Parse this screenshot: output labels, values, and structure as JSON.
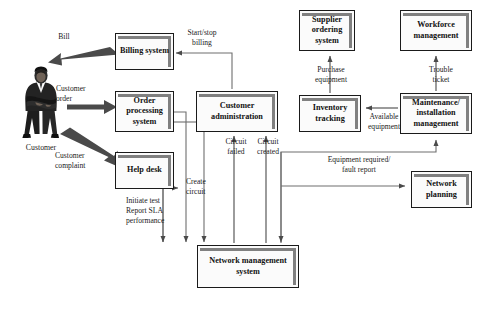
{
  "diagram": {
    "actor": {
      "name": "Customer",
      "icon": "person-businessman-icon"
    },
    "boxes": [
      {
        "id": "billing-system",
        "label": "Billing\nsystem",
        "x": 115,
        "y": 33,
        "w": 59,
        "h": 37
      },
      {
        "id": "order-processing",
        "label": "Order\nprocessing\nsystem",
        "x": 115,
        "y": 91,
        "w": 59,
        "h": 41
      },
      {
        "id": "help-desk",
        "label": "Help\ndesk",
        "x": 115,
        "y": 152,
        "w": 59,
        "h": 37
      },
      {
        "id": "customer-admin",
        "label": "Customer\nadministration",
        "x": 196,
        "y": 91,
        "w": 82,
        "h": 41
      },
      {
        "id": "supplier-ordering",
        "label": "Supplier\nordering\nsystem",
        "x": 299,
        "y": 10,
        "w": 56,
        "h": 41
      },
      {
        "id": "workforce-mgmt",
        "label": "Workforce\nmanagement",
        "x": 400,
        "y": 10,
        "w": 72,
        "h": 41
      },
      {
        "id": "inventory-tracking",
        "label": "Inventory\ntracking",
        "x": 299,
        "y": 95,
        "w": 62,
        "h": 37
      },
      {
        "id": "maintenance-install",
        "label": "Maintenance/\ninstallation\nmanagement",
        "x": 400,
        "y": 93,
        "w": 72,
        "h": 41
      },
      {
        "id": "network-planning",
        "label": "Network\nplanning",
        "x": 411,
        "y": 171,
        "w": 61,
        "h": 37
      },
      {
        "id": "network-mgmt",
        "label": "Network management\nsystem",
        "x": 197,
        "y": 245,
        "w": 102,
        "h": 43
      }
    ],
    "flow_labels": [
      {
        "id": "bill",
        "text": "Bill",
        "x": 44,
        "y": 32,
        "w": 40,
        "align": "center"
      },
      {
        "id": "customer-order",
        "text": "Customer\norder",
        "x": 56,
        "y": 84,
        "w": 52,
        "align": "left"
      },
      {
        "id": "customer-complaint",
        "text": "Customer\ncomplaint",
        "x": 55,
        "y": 151,
        "w": 54,
        "align": "left"
      },
      {
        "id": "start-stop-billing",
        "text": "Start/stop\nbilling",
        "x": 178,
        "y": 28,
        "w": 48,
        "align": "center"
      },
      {
        "id": "purchase-equipment",
        "text": "Purchase\nequipment",
        "x": 304,
        "y": 65,
        "w": 54,
        "align": "center"
      },
      {
        "id": "trouble-ticket",
        "text": "Trouble\nticket",
        "x": 419,
        "y": 65,
        "w": 44,
        "align": "center"
      },
      {
        "id": "available-equipment",
        "text": "Available\nequipment",
        "x": 360,
        "y": 112,
        "w": 48,
        "align": "center"
      },
      {
        "id": "circuit-failed",
        "text": "Circuit\nfailed",
        "x": 226,
        "y": 137,
        "w": 28,
        "align": "center"
      },
      {
        "id": "circuit-created",
        "text": "Circuit\ncreated",
        "x": 258,
        "y": 137,
        "w": 31,
        "align": "center"
      },
      {
        "id": "create-circuit",
        "text": "Create\ncircuit",
        "x": 186,
        "y": 177,
        "w": 30,
        "align": "left"
      },
      {
        "id": "initiate-test-sla",
        "text": "Initiate test\nReport SLA\nperformance",
        "x": 126,
        "y": 196,
        "w": 60,
        "align": "left"
      },
      {
        "id": "equipment-fault",
        "text": "Equipment required/\nfault report",
        "x": 313,
        "y": 155,
        "w": 90,
        "align": "center"
      }
    ],
    "colors": {
      "box_fill": "#fbfbfb",
      "box_border": "#1a1a1a",
      "box_shadow_bar": "#808080",
      "line": "#6e6e6e",
      "thick_arrow": "#4a4a4a",
      "text": "#1a1a1a"
    }
  }
}
